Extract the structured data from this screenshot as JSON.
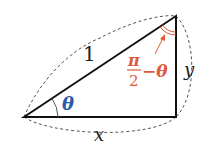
{
  "diagram": {
    "type": "right-triangle",
    "labels": {
      "hypotenuse": "1",
      "horizontal_leg": "x",
      "vertical_leg": "y",
      "angle_left": "θ",
      "angle_top_num": "π",
      "angle_top_den": "2",
      "angle_top_rest": "−θ"
    },
    "colors": {
      "lines": "#111111",
      "dashed": "#555555",
      "theta": "#2a5aa8",
      "complement": "#e05a3a"
    }
  }
}
